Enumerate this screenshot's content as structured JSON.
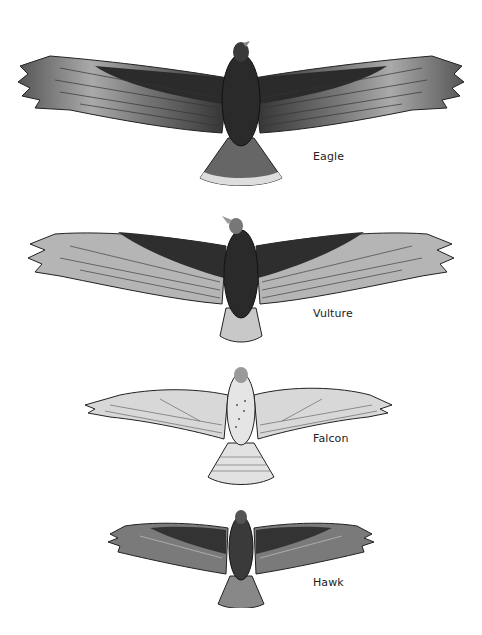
{
  "figure": {
    "birds": [
      {
        "name": "Eagle",
        "label": "Eagle",
        "icon": "eagle-silhouette-icon"
      },
      {
        "name": "Vulture",
        "label": "Vulture",
        "icon": "vulture-silhouette-icon"
      },
      {
        "name": "Falcon",
        "label": "Falcon",
        "icon": "falcon-silhouette-icon"
      },
      {
        "name": "Hawk",
        "label": "Hawk",
        "icon": "hawk-silhouette-icon"
      }
    ]
  },
  "colors": {
    "background": "#ffffff",
    "dark_plumage": "#2a2a2a",
    "mid_plumage": "#6e6e6e",
    "light_plumage": "#cfcfcf",
    "label_text": "#222222"
  }
}
